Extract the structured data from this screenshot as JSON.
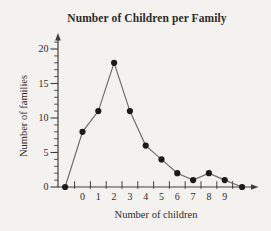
{
  "chart_data": {
    "type": "line",
    "title": "Number of Children per Family",
    "xlabel": "Number of children",
    "ylabel": "Number of families",
    "categories": [
      0,
      1,
      2,
      3,
      4,
      5,
      6,
      7,
      8,
      9
    ],
    "values": [
      8,
      11,
      18,
      11,
      6,
      4,
      2,
      1,
      2,
      1
    ],
    "series": [
      {
        "name": "Number of families",
        "values": [
          8,
          11,
          18,
          11,
          6,
          4,
          2,
          1,
          2,
          1
        ]
      }
    ],
    "anchor_points": [
      {
        "x": -1.1,
        "y": 0
      },
      {
        "x": 10.1,
        "y": 0
      }
    ],
    "x_tick_labels": [
      "0",
      "1",
      "2",
      "3",
      "4",
      "5",
      "6",
      "7",
      "8",
      "9"
    ],
    "x_boundary_ticks": [
      -0.5,
      0.5,
      1.5,
      2.5,
      3.5,
      4.5,
      5.5,
      6.5,
      7.5,
      8.5,
      9.5
    ],
    "y_tick_labels": [
      "0",
      "5",
      "10",
      "15",
      "20"
    ],
    "y_major_ticks": [
      0,
      5,
      10,
      15,
      20
    ],
    "y_minor_tick_step": 1,
    "xlim": [
      -1.5,
      10.8
    ],
    "ylim": [
      0,
      21
    ],
    "grid": false,
    "legend": "none",
    "marker": "filled-circle",
    "colors": {
      "line": "#6b6b6b",
      "point": "#1b1b1b",
      "axis": "#3f3f3f",
      "text": "#2e2c29",
      "background": "#f3f2ee"
    }
  }
}
